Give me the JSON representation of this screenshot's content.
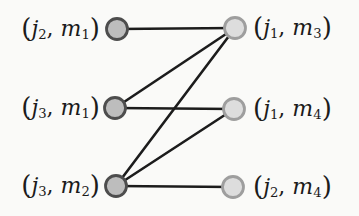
{
  "figure": {
    "kind": "bipartite-graph",
    "background": "#fafaf8",
    "text_color": "#1b1b1b",
    "edge_color": "#1c1c1c",
    "edge_width": 2.6,
    "node_radius": 10.5,
    "node_styles": {
      "left": {
        "fill": "#bdbdbd",
        "stroke": "#4d4d4d",
        "stroke_width": 2.8
      },
      "right": {
        "fill": "#dddddd",
        "stroke": "#9e9e9e",
        "stroke_width": 2.8
      }
    },
    "nodes": [
      {
        "id": "j2-m1",
        "side": "left",
        "x": 117,
        "y": 29,
        "label": {
          "open": "(",
          "var1": "j",
          "sub1": "2",
          "sep": ", ",
          "var2": "m",
          "sub2": "1",
          "close": ")"
        }
      },
      {
        "id": "j3-m1",
        "side": "left",
        "x": 115,
        "y": 108,
        "label": {
          "open": "(",
          "var1": "j",
          "sub1": "3",
          "sep": ", ",
          "var2": "m",
          "sub2": "1",
          "close": ")"
        }
      },
      {
        "id": "j3-m2",
        "side": "left",
        "x": 116,
        "y": 186,
        "label": {
          "open": "(",
          "var1": "j",
          "sub1": "3",
          "sep": ", ",
          "var2": "m",
          "sub2": "2",
          "close": ")"
        }
      },
      {
        "id": "j1-m3",
        "side": "right",
        "x": 235,
        "y": 28,
        "label": {
          "open": "(",
          "var1": "j",
          "sub1": "1",
          "sep": ", ",
          "var2": "m",
          "sub2": "3",
          "close": ")"
        }
      },
      {
        "id": "j1-m4",
        "side": "right",
        "x": 234,
        "y": 109,
        "label": {
          "open": "(",
          "var1": "j",
          "sub1": "1",
          "sep": ", ",
          "var2": "m",
          "sub2": "4",
          "close": ")"
        }
      },
      {
        "id": "j2-m4",
        "side": "right",
        "x": 233,
        "y": 187,
        "label": {
          "open": "(",
          "var1": "j",
          "sub1": "2",
          "sep": ", ",
          "var2": "m",
          "sub2": "4",
          "close": ")"
        }
      }
    ],
    "edges": [
      {
        "from": "j2-m1",
        "to": "j1-m3"
      },
      {
        "from": "j3-m1",
        "to": "j1-m3"
      },
      {
        "from": "j3-m1",
        "to": "j1-m4"
      },
      {
        "from": "j3-m2",
        "to": "j1-m3"
      },
      {
        "from": "j3-m2",
        "to": "j1-m4"
      },
      {
        "from": "j3-m2",
        "to": "j2-m4"
      }
    ]
  }
}
